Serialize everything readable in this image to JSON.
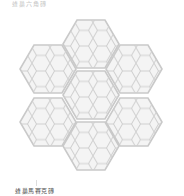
{
  "top_caption": "蜂巢六角磚",
  "bottom_caption": "蜂巢馬賽克磚",
  "image": {
    "subject": "hexagon-mosaic-tile-cluster",
    "tile_count": 7,
    "tile_fill": "#f4f4f4",
    "tile_stroke": "#c6c6c6"
  }
}
